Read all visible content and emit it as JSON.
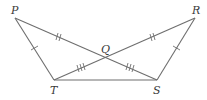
{
  "diagram": {
    "type": "geometry",
    "points": {
      "P": {
        "label": "P",
        "x": 15,
        "y": 18
      },
      "R": {
        "label": "R",
        "x": 195,
        "y": 18
      },
      "T": {
        "label": "T",
        "x": 54,
        "y": 80
      },
      "S": {
        "label": "S",
        "x": 157,
        "y": 80
      },
      "Q": {
        "label": "Q",
        "x": 105,
        "y": 58
      }
    },
    "segments": [
      {
        "from": "P",
        "to": "T",
        "ticks": 1
      },
      {
        "from": "R",
        "to": "S",
        "ticks": 1
      },
      {
        "from": "P",
        "to": "Q",
        "ticks": 2
      },
      {
        "from": "Q",
        "to": "R",
        "ticks": 2
      },
      {
        "from": "T",
        "to": "Q",
        "ticks": 3
      },
      {
        "from": "Q",
        "to": "S",
        "ticks": 3
      },
      {
        "from": "T",
        "to": "S",
        "ticks": 0
      }
    ],
    "labels": {
      "P": "P",
      "Q": "Q",
      "R": "R",
      "S": "S",
      "T": "T"
    },
    "colors": {
      "line": "#6e6e6e",
      "text": "#3a3a3a"
    }
  }
}
